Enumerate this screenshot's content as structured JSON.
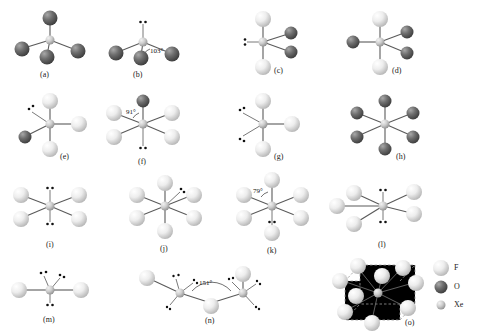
{
  "figure": {
    "background": "#ffffff",
    "colors": {
      "fluorine": "#e8e8e8",
      "oxygen": "#5a5a5a",
      "xenon": "#c9c9c9",
      "bond": "#5a5a5a",
      "dashed_lattice": "#9a9a9a",
      "text": "#1a1a1a"
    }
  },
  "legend": {
    "items": [
      {
        "symbol": "F",
        "label": "F",
        "atom": "fluorine",
        "color": "#e8e8e8",
        "radius": 7
      },
      {
        "symbol": "O",
        "label": "O",
        "atom": "oxygen",
        "color": "#5a5a5a",
        "radius": 6
      },
      {
        "symbol": "Xe",
        "label": "Xe",
        "atom": "xenon",
        "color": "#c9c9c9",
        "radius": 4
      }
    ]
  },
  "structures": [
    {
      "id": "a",
      "caption": "(a)",
      "formula": "XeO4",
      "geometry": "tetrahedral",
      "oxygen_count": 4,
      "fluorine_count": 0,
      "lone_pairs": 0,
      "angle_label": null
    },
    {
      "id": "b",
      "caption": "(b)",
      "formula": "XeO3",
      "geometry": "trigonal pyramidal",
      "oxygen_count": 3,
      "fluorine_count": 0,
      "lone_pairs": 1,
      "angle_label": "103°"
    },
    {
      "id": "c",
      "caption": "(c)",
      "formula": "XeO2F2",
      "geometry": "see-saw",
      "oxygen_count": 2,
      "fluorine_count": 2,
      "lone_pairs": 1,
      "angle_label": null
    },
    {
      "id": "d",
      "caption": "(d)",
      "formula": "XeO3F2",
      "geometry": "trigonal bipyramidal",
      "oxygen_count": 3,
      "fluorine_count": 2,
      "lone_pairs": 0,
      "angle_label": null
    },
    {
      "id": "e",
      "caption": "(e)",
      "formula": "XeOF3",
      "geometry": "see-saw",
      "oxygen_count": 1,
      "fluorine_count": 3,
      "lone_pairs": 1,
      "angle_label": null
    },
    {
      "id": "f",
      "caption": "(f)",
      "formula": "XeOF4",
      "geometry": "square pyramidal",
      "oxygen_count": 1,
      "fluorine_count": 4,
      "lone_pairs": 1,
      "angle_label": "91°"
    },
    {
      "id": "g",
      "caption": "(g)",
      "formula": "XeF3",
      "geometry": "T-shaped",
      "oxygen_count": 0,
      "fluorine_count": 3,
      "lone_pairs": 2,
      "angle_label": null
    },
    {
      "id": "h",
      "caption": "(h)",
      "formula": "XeO6",
      "geometry": "octahedral",
      "oxygen_count": 6,
      "fluorine_count": 0,
      "lone_pairs": 0,
      "angle_label": null
    },
    {
      "id": "i",
      "caption": "(i)",
      "formula": "XeF4",
      "geometry": "square planar",
      "oxygen_count": 0,
      "fluorine_count": 4,
      "lone_pairs": 2,
      "angle_label": null
    },
    {
      "id": "j",
      "caption": "(j)",
      "formula": "XeF6",
      "geometry": "distorted octahedral",
      "oxygen_count": 0,
      "fluorine_count": 6,
      "lone_pairs": 1,
      "angle_label": null
    },
    {
      "id": "k",
      "caption": "(k)",
      "formula": "XeF6",
      "geometry": "pentagonal bipyramidal",
      "oxygen_count": 0,
      "fluorine_count": 6,
      "lone_pairs": 1,
      "angle_label": "79°"
    },
    {
      "id": "l",
      "caption": "(l)",
      "formula": "XeF5",
      "geometry": "pentagonal planar",
      "oxygen_count": 0,
      "fluorine_count": 5,
      "lone_pairs": 2,
      "angle_label": null
    },
    {
      "id": "m",
      "caption": "(m)",
      "formula": "XeF2",
      "geometry": "linear",
      "oxygen_count": 0,
      "fluorine_count": 2,
      "lone_pairs": 3,
      "angle_label": null
    },
    {
      "id": "n",
      "caption": "(n)",
      "formula": "(XeF5)+ bridged chain",
      "geometry": "fluorine-bridged dimer",
      "oxygen_count": 0,
      "fluorine_count": 7,
      "lone_pairs": 6,
      "angle_label": "151°"
    },
    {
      "id": "o",
      "caption": "(o)",
      "formula": "XeF6 tetramer / lattice",
      "geometry": "cubic lattice cage",
      "oxygen_count": 0,
      "fluorine_count": 12,
      "lone_pairs": 0,
      "angle_label": null
    }
  ]
}
